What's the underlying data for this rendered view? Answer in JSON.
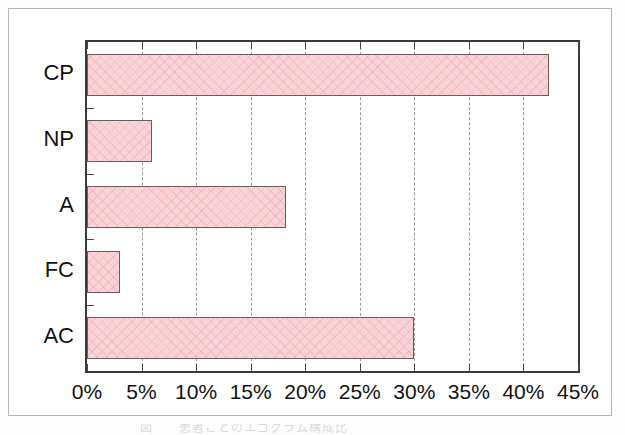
{
  "figure": {
    "caption_remnant": "図　　患者ごとのエゴグラム構成比"
  },
  "chart_data": {
    "type": "bar",
    "orientation": "horizontal",
    "title": "",
    "xlabel": "",
    "ylabel": "",
    "categories": [
      "CP",
      "NP",
      "A",
      "FC",
      "AC"
    ],
    "values": [
      42.3,
      6.0,
      18.2,
      3.0,
      30.0
    ],
    "series": [
      {
        "name": "",
        "values": [
          42.3,
          6.0,
          18.2,
          3.0,
          30.0
        ]
      }
    ],
    "xlim": [
      0,
      45
    ],
    "xticks": [
      0,
      5,
      10,
      15,
      20,
      25,
      30,
      35,
      40,
      45
    ],
    "xticklabels": [
      "0%",
      "5%",
      "10%",
      "15%",
      "20%",
      "25%",
      "30%",
      "35%",
      "40%",
      "45%"
    ],
    "grid": "vertical-dashed",
    "legend": "none",
    "bar_color": "#f9d3d7",
    "bar_edge_color": "#6f5a5c",
    "axis_color": "#3a3a3a",
    "grid_color": "#9a9a9a",
    "background_color": "#ffffff"
  }
}
